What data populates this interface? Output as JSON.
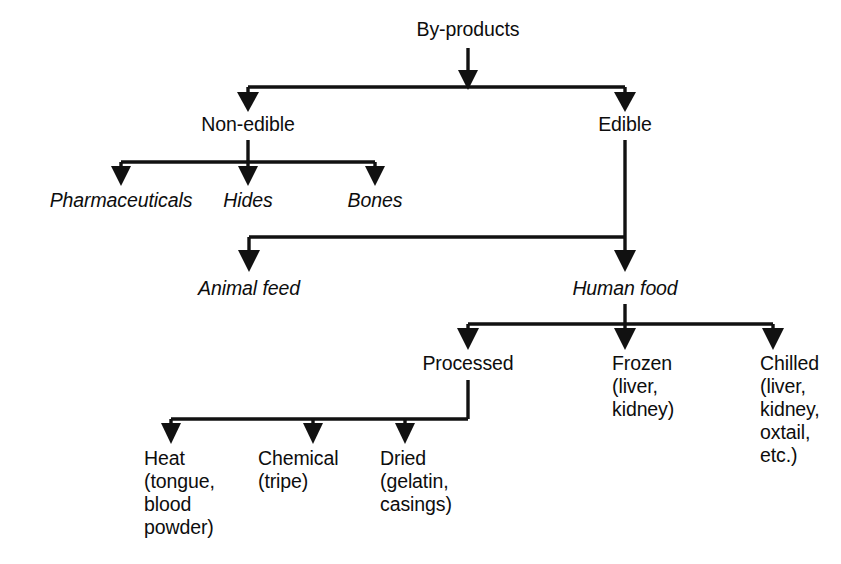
{
  "diagram": {
    "line_color": "#111111",
    "text_color": "#0d0d0d",
    "background": "#ffffff",
    "nodes": [
      {
        "id": "by-products",
        "label": "By-products",
        "style": "plain",
        "x": 468,
        "y": 18,
        "align": "center"
      },
      {
        "id": "non-edible",
        "label": "Non-edible",
        "style": "plain",
        "x": 248,
        "y": 113,
        "align": "center"
      },
      {
        "id": "edible",
        "label": "Edible",
        "style": "plain",
        "x": 625,
        "y": 113,
        "align": "center"
      },
      {
        "id": "pharmaceuticals",
        "label": "Pharmaceuticals",
        "style": "italic",
        "x": 121,
        "y": 189,
        "align": "center"
      },
      {
        "id": "hides",
        "label": "Hides",
        "style": "italic",
        "x": 248,
        "y": 189,
        "align": "center"
      },
      {
        "id": "bones",
        "label": "Bones",
        "style": "italic",
        "x": 375,
        "y": 189,
        "align": "center"
      },
      {
        "id": "animal-feed",
        "label": "Animal feed",
        "style": "italic",
        "x": 249,
        "y": 277,
        "align": "center"
      },
      {
        "id": "human-food",
        "label": "Human food",
        "style": "italic",
        "x": 625,
        "y": 277,
        "align": "center"
      },
      {
        "id": "processed",
        "label": "Processed",
        "style": "plain",
        "x": 468,
        "y": 352,
        "align": "center"
      },
      {
        "id": "frozen",
        "label": "Frozen\n(liver,\nkidney)",
        "style": "plain",
        "x": 612,
        "y": 352,
        "align": "left"
      },
      {
        "id": "chilled",
        "label": "Chilled\n(liver,\nkidney,\noxtail,\netc.)",
        "style": "plain",
        "x": 760,
        "y": 352,
        "align": "left"
      },
      {
        "id": "heat",
        "label": "Heat\n(tongue,\nblood\npowder)",
        "style": "plain",
        "x": 144,
        "y": 447,
        "align": "left"
      },
      {
        "id": "chemical",
        "label": "Chemical\n(tripe)",
        "style": "plain",
        "x": 258,
        "y": 447,
        "align": "left"
      },
      {
        "id": "dried",
        "label": "Dried\n(gelatin,\ncasings)",
        "style": "plain",
        "x": 380,
        "y": 447,
        "align": "left"
      }
    ],
    "edges": [
      {
        "id": "edge-byproducts-bus",
        "from": "by-products",
        "to": "split-level-1"
      },
      {
        "id": "edge-bus-non-edible",
        "from": "split-level-1",
        "to": "non-edible"
      },
      {
        "id": "edge-bus-edible",
        "from": "split-level-1",
        "to": "edible"
      },
      {
        "id": "edge-non-edible-bus",
        "from": "non-edible",
        "to": "split-level-2"
      },
      {
        "id": "edge-bus-pharmaceuticals",
        "from": "split-level-2",
        "to": "pharmaceuticals"
      },
      {
        "id": "edge-bus-hides",
        "from": "split-level-2",
        "to": "hides"
      },
      {
        "id": "edge-bus-bones",
        "from": "split-level-2",
        "to": "bones"
      },
      {
        "id": "edge-edible-animal-feed",
        "from": "edible",
        "to": "animal-feed"
      },
      {
        "id": "edge-edible-human-food",
        "from": "edible",
        "to": "human-food"
      },
      {
        "id": "edge-human-food-bus",
        "from": "human-food",
        "to": "split-level-3"
      },
      {
        "id": "edge-bus-processed",
        "from": "split-level-3",
        "to": "processed"
      },
      {
        "id": "edge-bus-frozen",
        "from": "split-level-3",
        "to": "frozen"
      },
      {
        "id": "edge-bus-chilled",
        "from": "split-level-3",
        "to": "chilled"
      },
      {
        "id": "edge-processed-bus",
        "from": "processed",
        "to": "split-level-4"
      },
      {
        "id": "edge-bus-heat",
        "from": "split-level-4",
        "to": "heat"
      },
      {
        "id": "edge-bus-chemical",
        "from": "split-level-4",
        "to": "chemical"
      },
      {
        "id": "edge-bus-dried",
        "from": "split-level-4",
        "to": "dried"
      }
    ]
  }
}
